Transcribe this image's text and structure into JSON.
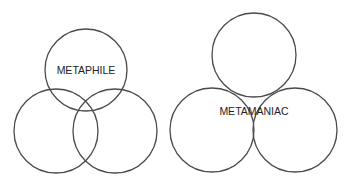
{
  "diagrams": [
    {
      "name": "metaphile",
      "label": "METAPHILE",
      "circles": [
        {
          "cx": 86,
          "cy": 70,
          "r": 41
        },
        {
          "cx": 56,
          "cy": 131,
          "r": 42
        },
        {
          "cx": 115,
          "cy": 131,
          "r": 42
        }
      ],
      "label_pos": {
        "x": 86,
        "y": 74
      }
    },
    {
      "name": "metamaniac",
      "label": "METAMANIAC",
      "circles": [
        {
          "cx": 254,
          "cy": 55,
          "r": 42
        },
        {
          "cx": 212,
          "cy": 130,
          "r": 42
        },
        {
          "cx": 295,
          "cy": 130,
          "r": 42
        }
      ],
      "label_pos": {
        "x": 254,
        "y": 115
      }
    }
  ],
  "colors": {
    "stroke": "#4a4a4a",
    "text": "#222222",
    "background": "#ffffff"
  }
}
